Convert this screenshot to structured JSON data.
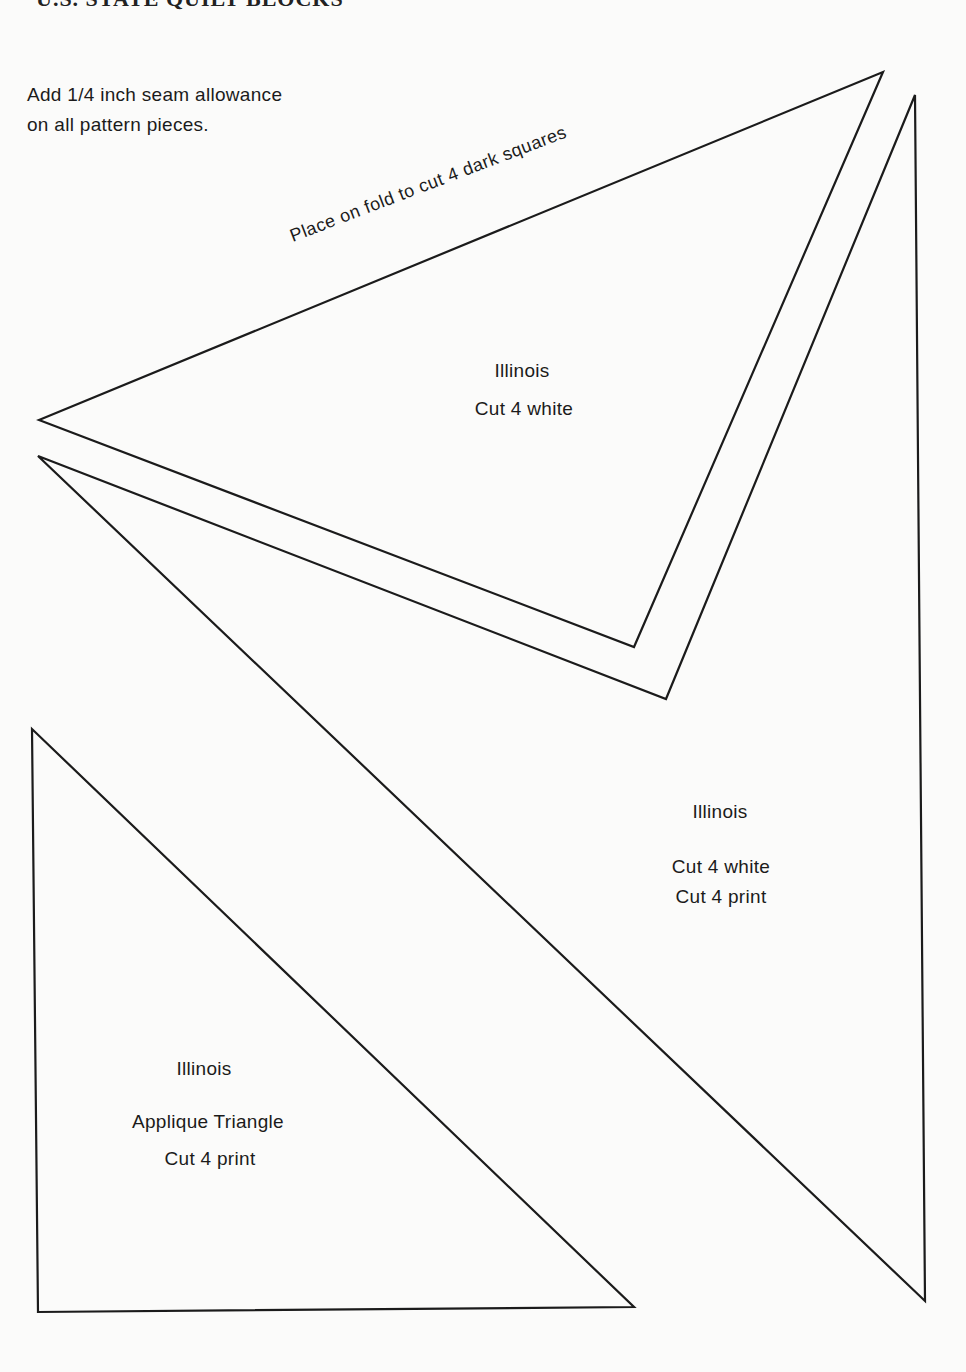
{
  "header": {
    "title_partial": "U.S. STATE QUILT BLOCKS"
  },
  "instructions": {
    "line1": "Add 1/4 inch seam allowance",
    "line2": "on all pattern pieces."
  },
  "pieces": [
    {
      "id": "triangle-1",
      "fold_note": "Place on fold to cut 4 dark squares",
      "name": "Illinois",
      "cut": [
        "Cut 4 white"
      ],
      "points": "39,420 883,72 634,647"
    },
    {
      "id": "chevron-2",
      "name": "Illinois",
      "cut": [
        "Cut 4 white",
        "Cut 4 print"
      ],
      "points": "38,456 666,699 915,95 925,1301"
    },
    {
      "id": "applique-triangle",
      "name": "Illinois",
      "subtitle": "Applique Triangle",
      "cut": [
        "Cut 4 print"
      ],
      "points": "32,729 38,1312 634,1307"
    }
  ],
  "colors": {
    "paper": "#fbfbfa",
    "ink": "#1b1b1b"
  }
}
